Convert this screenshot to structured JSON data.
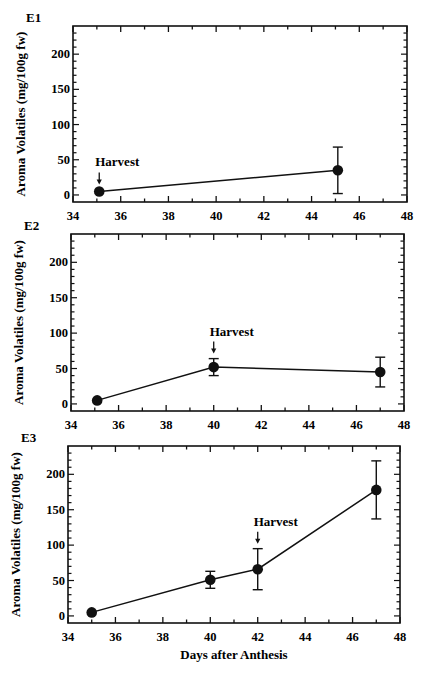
{
  "chart_data": [
    {
      "type": "line",
      "panel_label": "E1",
      "title": "",
      "xlabel": "",
      "ylabel": "Aroma Volatiles (mg/100g fw)",
      "xlim": [
        34,
        48
      ],
      "ylim": [
        -10,
        240
      ],
      "xticks": [
        34,
        36,
        38,
        40,
        42,
        44,
        46,
        48
      ],
      "yticks": [
        0,
        50,
        100,
        150,
        200
      ],
      "grid": false,
      "series": [
        {
          "name": "E1",
          "x": [
            35.1,
            45.1
          ],
          "y": [
            5,
            35
          ],
          "err": [
            null,
            33
          ]
        }
      ],
      "annotations": [
        {
          "text": "Harvest",
          "x": 35.1,
          "arrow": true
        }
      ],
      "frame": {
        "left": 73,
        "top": 26,
        "right": 407,
        "bottom": 202
      }
    },
    {
      "type": "line",
      "panel_label": "E2",
      "title": "",
      "xlabel": "",
      "ylabel": "Aroma Volatiles (mg/100g fw)",
      "xlim": [
        34,
        48
      ],
      "ylim": [
        -10,
        240
      ],
      "xticks": [
        34,
        36,
        38,
        40,
        42,
        44,
        46,
        48
      ],
      "yticks": [
        0,
        50,
        100,
        150,
        200
      ],
      "grid": false,
      "series": [
        {
          "name": "E2",
          "x": [
            35.1,
            40.0,
            47.0
          ],
          "y": [
            5,
            52,
            45
          ],
          "err": [
            null,
            12,
            21
          ]
        }
      ],
      "annotations": [
        {
          "text": "Harvest",
          "x": 40.0,
          "arrow": true
        }
      ],
      "frame": {
        "left": 71,
        "top": 234,
        "right": 404,
        "bottom": 411
      }
    },
    {
      "type": "line",
      "panel_label": "E3",
      "title": "",
      "xlabel": "Days after Anthesis",
      "ylabel": "Aroma Volatiles (mg/100g fw)",
      "xlim": [
        34,
        48
      ],
      "ylim": [
        -10,
        240
      ],
      "xticks": [
        34,
        36,
        38,
        40,
        42,
        44,
        46,
        48
      ],
      "yticks": [
        0,
        50,
        100,
        150,
        200
      ],
      "grid": false,
      "series": [
        {
          "name": "E3",
          "x": [
            35.0,
            40.0,
            42.0,
            47.0
          ],
          "y": [
            5,
            51,
            66,
            178
          ],
          "err": [
            null,
            12,
            29,
            41
          ]
        }
      ],
      "annotations": [
        {
          "text": "Harvest",
          "x": 42.0,
          "arrow": true
        }
      ],
      "frame": {
        "left": 68,
        "top": 446,
        "right": 400,
        "bottom": 623
      }
    }
  ]
}
